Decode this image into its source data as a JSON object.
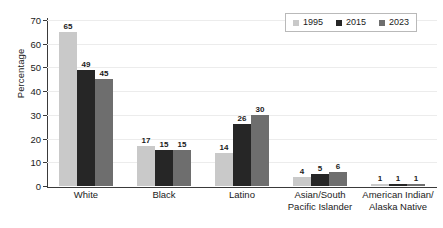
{
  "chart_data": {
    "type": "bar",
    "title": "",
    "xlabel": "",
    "ylabel": "Percentage",
    "ylim": [
      0,
      70
    ],
    "yticks": [
      0,
      10,
      20,
      30,
      40,
      50,
      60,
      70
    ],
    "grid": true,
    "legend_position": "top-right",
    "categories": [
      "White",
      "Black",
      "Latino",
      "Asian/South\nPacific Islander",
      "American Indian/\nAlaska Native"
    ],
    "category_lines": [
      [
        "White"
      ],
      [
        "Black"
      ],
      [
        "Latino"
      ],
      [
        "Asian/South",
        "Pacific Islander"
      ],
      [
        "American Indian/",
        "Alaska Native"
      ]
    ],
    "series": [
      {
        "name": "1995",
        "color": "#c9c9c9",
        "values": [
          65,
          17,
          14,
          4,
          1
        ]
      },
      {
        "name": "2015",
        "color": "#262626",
        "values": [
          49,
          15,
          26,
          5,
          1
        ]
      },
      {
        "name": "2023",
        "color": "#6e6e6e",
        "values": [
          45,
          15,
          30,
          6,
          1
        ]
      }
    ]
  },
  "legend": {
    "items": [
      {
        "label": "1995",
        "color": "#c9c9c9"
      },
      {
        "label": "2015",
        "color": "#262626"
      },
      {
        "label": "2023",
        "color": "#6e6e6e"
      }
    ]
  }
}
